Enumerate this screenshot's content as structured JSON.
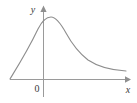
{
  "figure": {
    "kind": "math-plot",
    "width": 137,
    "height": 103,
    "background_color": "#ffffff"
  },
  "labels": {
    "y_axis": "y",
    "x_axis": "x",
    "origin": "0"
  },
  "colors": {
    "axis": "#9a9a9a",
    "arrow": "#8f8f8f",
    "curve": "#8d8d8d",
    "text": "#3a3a3a",
    "background": "#ffffff"
  },
  "chart_data": {
    "type": "line",
    "title": "",
    "subtitle": "",
    "xlabel": "x",
    "ylabel": "y",
    "legend": [],
    "legend_position": "none",
    "grid": false,
    "annotations": [
      "0"
    ],
    "axes": {
      "x_axis_pixel_y": 79,
      "y_axis_pixel_x": 43,
      "x_axis_from_px": 10,
      "x_axis_to_px": 127,
      "y_axis_top_px": 8,
      "y_axis_bottom_px": 97,
      "x_arrow": true,
      "y_arrow": true,
      "ticks_shown": false
    },
    "curve_points_px": [
      [
        10,
        79
      ],
      [
        14,
        72
      ],
      [
        18,
        65
      ],
      [
        22,
        58
      ],
      [
        26,
        51
      ],
      [
        30,
        44
      ],
      [
        34,
        36
      ],
      [
        38,
        28
      ],
      [
        42,
        22
      ],
      [
        46,
        18
      ],
      [
        50,
        17
      ],
      [
        54,
        18
      ],
      [
        58,
        21
      ],
      [
        62,
        26
      ],
      [
        66,
        32
      ],
      [
        70,
        38
      ],
      [
        74,
        44
      ],
      [
        78,
        49
      ],
      [
        82,
        54
      ],
      [
        86,
        58
      ],
      [
        90,
        61
      ],
      [
        94,
        64
      ],
      [
        98,
        66
      ],
      [
        102,
        68
      ],
      [
        106,
        69
      ],
      [
        110,
        70
      ],
      [
        114,
        70
      ],
      [
        118,
        71
      ],
      [
        122,
        71
      ],
      [
        126,
        71
      ]
    ],
    "curve_path": "M 10 79 C 18 66, 28 50, 38 29 C 42 21, 47 17, 51 17 C 56 17, 61 24, 66 33 C 72 44, 79 53, 88 60 C 97 66, 108 70, 126 71",
    "peak_px": [
      50,
      17
    ],
    "x": [
      0,
      1,
      2,
      3,
      4,
      5,
      6,
      7,
      8,
      9,
      10
    ],
    "values": [
      0,
      0.62,
      1.0,
      0.88,
      0.64,
      0.44,
      0.3,
      0.2,
      0.14,
      0.1,
      0.08
    ],
    "xlim": [
      -1.1,
      2.4
    ],
    "ylim": [
      0,
      1.1
    ]
  }
}
